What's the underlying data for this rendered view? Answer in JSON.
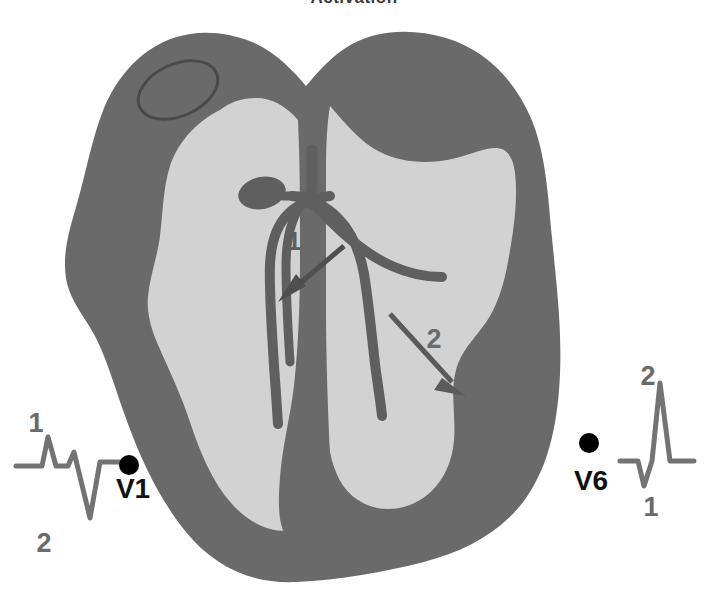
{
  "figure": {
    "title": "Activation",
    "type": "cardiac-conduction-cross-section"
  },
  "colors": {
    "background": "#ffffff",
    "myocardium": "#6a6a6a",
    "chamber": "#d2d2d2",
    "conduction": "#5f5f5f",
    "septum": "#6a6a6a",
    "ecg_trace": "#737373",
    "electrode_dot": "#000000",
    "label_text": "#111111",
    "number_text": "#6a6a6a"
  },
  "heart": {
    "name": "ventricular-cross-section",
    "atrial_appendage_label": "atrial-appendage-ellipse",
    "right_ventricle_label": "right-ventricle-cavity",
    "left_ventricle_label": "left-ventricle-cavity",
    "septum_label": "interventricular-septum"
  },
  "conduction_system": {
    "av_node": "AV node",
    "his_bundle": "His bundle",
    "right_bundle_branch": "Right bundle branch",
    "left_bundle_branch": "Left bundle branch",
    "left_anterior_fascicle": "Left anterior fascicle",
    "left_posterior_fascicle": "Left posterior fascicle"
  },
  "activation_arrows": [
    {
      "id": "arrow-1",
      "label": "1",
      "direction": "down-left",
      "meaning": "first activation vector toward the septum and left ventricle"
    },
    {
      "id": "arrow-2",
      "label": "2",
      "direction": "down-right",
      "meaning": "second activation vector toward the right ventricular free wall"
    }
  ],
  "ecg": {
    "v1": {
      "lead_label": "V1",
      "electrode": "electrode-dot-v1",
      "deflections": [
        {
          "label": "1",
          "polarity": "positive",
          "position": "above",
          "wave": "r"
        },
        {
          "label": "2",
          "polarity": "negative",
          "position": "below",
          "wave": "S"
        }
      ]
    },
    "v6": {
      "lead_label": "V6",
      "electrode": "electrode-dot-v6",
      "deflections": [
        {
          "label": "1",
          "polarity": "negative",
          "position": "below",
          "wave": "q"
        },
        {
          "label": "2",
          "polarity": "positive",
          "position": "above",
          "wave": "R"
        }
      ]
    }
  }
}
